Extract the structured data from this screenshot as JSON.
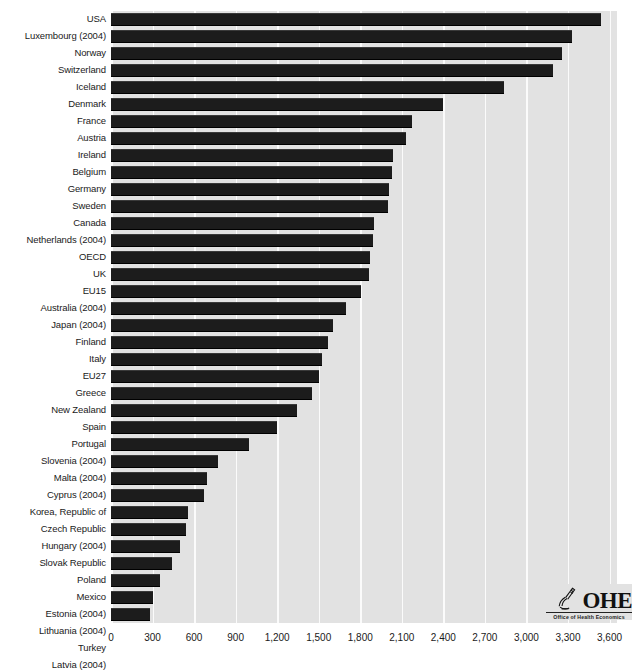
{
  "chart_data": {
    "type": "bar",
    "orientation": "horizontal",
    "title": "",
    "subtitle": "",
    "xlabel": "",
    "ylabel": "",
    "xlim": [
      0,
      3600
    ],
    "xticks": [
      0,
      300,
      600,
      900,
      1200,
      1500,
      1800,
      2100,
      2400,
      2700,
      3000,
      3300,
      3600
    ],
    "xtick_labels": [
      "0",
      "300",
      "600",
      "900",
      "1,200",
      "1,500",
      "1,800",
      "2,100",
      "2,400",
      "2,700",
      "3,000",
      "3,300",
      "3,600"
    ],
    "grid": "vertical-white",
    "legend": "none",
    "categories": [
      "USA",
      "Luxembourg (2004)",
      "Norway",
      "Switzerland",
      "Iceland",
      "Denmark",
      "France",
      "Austria",
      "Ireland",
      "Belgium",
      "Germany",
      "Sweden",
      "Canada",
      "Netherlands (2004)",
      "OECD",
      "UK",
      "EU15",
      "Australia (2004)",
      "Japan (2004)",
      "Finland",
      "Italy",
      "EU27",
      "Greece",
      "New Zealand",
      "Spain",
      "Portugal",
      "Slovenia (2004)",
      "Malta (2004)",
      "Cyprus (2004)",
      "Korea, Republic of",
      "Czech Republic",
      "Hungary (2004)",
      "Slovak Republic",
      "Poland",
      "Mexico",
      "Estonia (2004)",
      "Lithuania (2004)",
      "Turkey",
      "Latvia (2004)",
      "Bulgaria",
      "Romania"
    ],
    "values": [
      3540,
      3330,
      3260,
      3190,
      2840,
      2400,
      2175,
      2130,
      2035,
      2030,
      2010,
      2000,
      1900,
      1890,
      1870,
      1860,
      1805,
      1700,
      1600,
      1570,
      1525,
      1505,
      1450,
      1345,
      1200,
      1000,
      775,
      690,
      670,
      555,
      545,
      500,
      440,
      355,
      300,
      285,
      265,
      235,
      225,
      185,
      145
    ],
    "bar_color": "#1c1c1c",
    "plot_background": "#e2e2e2",
    "gridline_color": "#fbfbfb"
  },
  "logo": {
    "name": "ohe-logo",
    "wordmark": "OHE",
    "tagline": "Office of Health Economics",
    "mark_icon": "microscope-icon"
  }
}
